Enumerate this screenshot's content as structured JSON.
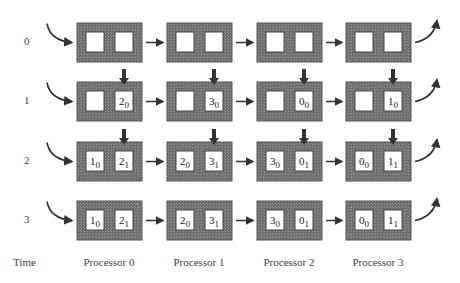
{
  "diagram": {
    "type": "systolic-pipeline",
    "time_axis_label": "Time",
    "time_steps": [
      "0",
      "1",
      "2",
      "3"
    ],
    "processors": [
      "Processor 0",
      "Processor 1",
      "Processor 2",
      "Processor 3"
    ],
    "colors": {
      "box_fill": "#7a7a7a",
      "cell_fill": "#ffffff",
      "arrow": "#333333"
    },
    "rows": [
      {
        "time": "0",
        "input_arrows": false,
        "cells": [
          [
            [
              "",
              ""
            ],
            [
              "",
              ""
            ]
          ],
          [
            [
              "",
              ""
            ],
            [
              "",
              ""
            ]
          ],
          [
            [
              "",
              ""
            ],
            [
              "",
              ""
            ]
          ],
          [
            [
              "",
              ""
            ],
            [
              "",
              ""
            ]
          ]
        ]
      },
      {
        "time": "1",
        "input_arrows": true,
        "cells": [
          [
            [
              "",
              ""
            ],
            [
              "2",
              "0"
            ]
          ],
          [
            [
              "",
              ""
            ],
            [
              "3",
              "0"
            ]
          ],
          [
            [
              "",
              ""
            ],
            [
              "0",
              "0"
            ]
          ],
          [
            [
              "",
              ""
            ],
            [
              "1",
              "0"
            ]
          ]
        ]
      },
      {
        "time": "2",
        "input_arrows": true,
        "cells": [
          [
            [
              "1",
              "0"
            ],
            [
              "2",
              "1"
            ]
          ],
          [
            [
              "2",
              "0"
            ],
            [
              "3",
              "1"
            ]
          ],
          [
            [
              "3",
              "0"
            ],
            [
              "0",
              "1"
            ]
          ],
          [
            [
              "0",
              "0"
            ],
            [
              "1",
              "1"
            ]
          ]
        ]
      },
      {
        "time": "3",
        "input_arrows": false,
        "cells": [
          [
            [
              "1",
              "0"
            ],
            [
              "2",
              "1"
            ]
          ],
          [
            [
              "2",
              "0"
            ],
            [
              "3",
              "1"
            ]
          ],
          [
            [
              "3",
              "0"
            ],
            [
              "0",
              "1"
            ]
          ],
          [
            [
              "0",
              "0"
            ],
            [
              "1",
              "1"
            ]
          ]
        ]
      }
    ]
  }
}
